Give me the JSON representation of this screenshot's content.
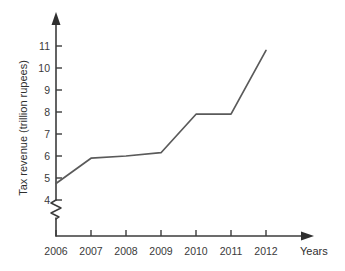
{
  "chart_data": {
    "type": "line",
    "title": "",
    "subtitle": "",
    "xlabel": "Years",
    "ylabel": "Tax revenue (trillion rupees)",
    "categories": [
      "2006",
      "2007",
      "2008",
      "2009",
      "2010",
      "2011",
      "2012"
    ],
    "x": [
      2006,
      2007,
      2008,
      2009,
      2010,
      2011,
      2012
    ],
    "values": [
      4.75,
      5.9,
      6.0,
      6.15,
      7.9,
      7.9,
      10.8
    ],
    "series": [
      {
        "name": "Tax revenue",
        "values": [
          4.75,
          5.9,
          6.0,
          6.15,
          7.9,
          7.9,
          10.8
        ],
        "color": "#5a5a5a"
      }
    ],
    "ylim": [
      4,
      11.4
    ],
    "xlim": [
      2006,
      2012
    ],
    "ytick_labels": [
      "11",
      "10",
      "9",
      "8",
      "7",
      "6",
      "5",
      "4"
    ],
    "ytick_values": [
      11,
      10,
      9,
      8,
      7,
      6,
      5,
      4
    ],
    "xtick_labels": [
      "2006",
      "2007",
      "2008",
      "2009",
      "2010",
      "2011",
      "2012"
    ],
    "grid": false,
    "legend": false,
    "legend_position": "none",
    "axis_break": {
      "axis": "y",
      "present": true,
      "below_value": 4,
      "style": "zigzag"
    },
    "annotations": [],
    "axis_arrows": {
      "y_axis": "up",
      "x_axis": "right"
    },
    "colors": {
      "line": "#5a5a5a",
      "axis": "#3c3c3c",
      "text": "#3a3a3a",
      "background": "#ffffff"
    }
  },
  "ytick_labels": {
    "t0": "11",
    "t1": "10",
    "t2": "9",
    "t3": "8",
    "t4": "7",
    "t5": "6",
    "t6": "5",
    "t7": "4"
  },
  "xtick_labels": {
    "t0": "2006",
    "t1": "2007",
    "t2": "2008",
    "t3": "2009",
    "t4": "2010",
    "t5": "2011",
    "t6": "2012"
  },
  "axis_titles": {
    "y": "Tax revenue (trillion rupees)",
    "x": "Years"
  }
}
